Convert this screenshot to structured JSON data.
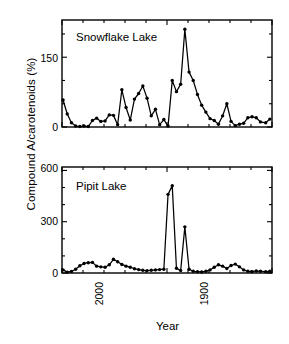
{
  "figure": {
    "ylabel": "Compound A/carotenoids (%)",
    "xlabel": "Year",
    "line_color": "#000000",
    "background_color": "#ffffff"
  },
  "axis": {
    "x_ticks": [
      {
        "value": 2000,
        "label": "2000"
      },
      {
        "value": 1900,
        "label": "1900"
      },
      {
        "value": 1800,
        "label": "1800"
      }
    ],
    "top_y_ticks": [
      {
        "value": 0,
        "label": "0"
      },
      {
        "value": 150,
        "label": "150"
      }
    ],
    "bottom_y_ticks": [
      {
        "value": 0,
        "label": "0"
      },
      {
        "value": 300,
        "label": "300"
      },
      {
        "value": 600,
        "label": "600"
      }
    ]
  },
  "chart_data": [
    {
      "type": "line",
      "title": "Snowflake Lake",
      "xlabel": "Year",
      "ylabel": "Compound A/carotenoids (%)",
      "xlim": [
        2000,
        1800
      ],
      "ylim": [
        0,
        230
      ],
      "x_reversed": true,
      "grid": false,
      "legend": "none",
      "marker": "filled-circle",
      "x": [
        1999,
        1995,
        1991,
        1987,
        1983,
        1979,
        1975,
        1971,
        1967,
        1963,
        1959,
        1955,
        1951,
        1947,
        1943,
        1939,
        1935,
        1931,
        1927,
        1923,
        1919,
        1915,
        1911,
        1907,
        1903,
        1899,
        1895,
        1891,
        1887,
        1883,
        1879,
        1875,
        1871,
        1867,
        1863,
        1859,
        1855,
        1851,
        1847,
        1843,
        1839,
        1835,
        1831,
        1827,
        1823,
        1819,
        1815,
        1811,
        1806,
        1802
      ],
      "values": [
        58,
        28,
        9,
        2,
        1,
        2,
        1,
        14,
        19,
        12,
        13,
        26,
        25,
        5,
        80,
        42,
        15,
        60,
        72,
        88,
        62,
        24,
        38,
        5,
        16,
        2,
        100,
        76,
        92,
        210,
        118,
        100,
        70,
        47,
        32,
        18,
        14,
        6,
        24,
        50,
        12,
        3,
        6,
        8,
        20,
        22,
        20,
        11,
        9,
        17
      ],
      "annotations": [
        {
          "text": "Snowflake Lake",
          "x": 1975,
          "y": 190
        }
      ]
    },
    {
      "type": "line",
      "title": "Pipit Lake",
      "xlabel": "Year",
      "ylabel": "Compound A/carotenoids (%)",
      "xlim": [
        2000,
        1800
      ],
      "ylim": [
        0,
        620
      ],
      "x_reversed": true,
      "grid": false,
      "legend": "none",
      "marker": "filled-circle",
      "x": [
        1999,
        1995,
        1991,
        1987,
        1983,
        1979,
        1975,
        1971,
        1967,
        1963,
        1959,
        1955,
        1951,
        1947,
        1943,
        1939,
        1935,
        1931,
        1927,
        1923,
        1919,
        1915,
        1911,
        1907,
        1903,
        1899,
        1895,
        1891,
        1887,
        1883,
        1879,
        1875,
        1871,
        1867,
        1863,
        1859,
        1855,
        1851,
        1847,
        1843,
        1839,
        1835,
        1831,
        1827,
        1823,
        1819,
        1815,
        1811,
        1806,
        1802
      ],
      "values": [
        18,
        5,
        9,
        22,
        42,
        56,
        60,
        62,
        40,
        36,
        34,
        48,
        80,
        66,
        50,
        40,
        34,
        25,
        20,
        16,
        14,
        16,
        18,
        20,
        22,
        460,
        510,
        28,
        14,
        270,
        22,
        10,
        8,
        6,
        10,
        18,
        34,
        48,
        40,
        26,
        44,
        52,
        36,
        18,
        10,
        8,
        12,
        10,
        8,
        10
      ],
      "annotations": [
        {
          "text": "Pipit Lake",
          "x": 1975,
          "y": 520
        }
      ]
    }
  ]
}
